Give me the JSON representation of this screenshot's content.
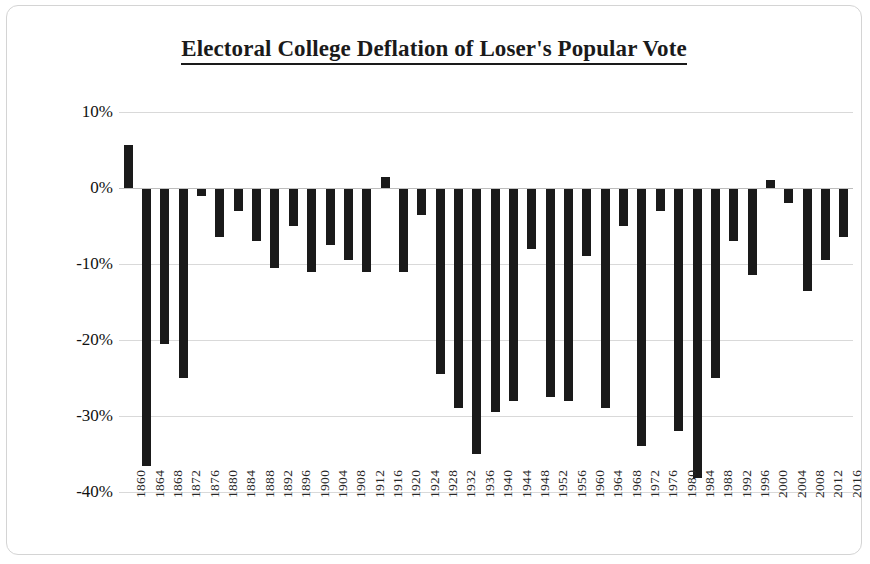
{
  "chart_data": {
    "type": "bar",
    "title": "Electoral College Deflation of Loser's Popular Vote",
    "xlabel": "",
    "ylabel": "Electoral Vote % Minus Popular Vote  %",
    "ylim": [
      -40,
      10
    ],
    "ytick_labels": [
      "10%",
      "0%",
      "-10%",
      "-20%",
      "-30%",
      "-40%"
    ],
    "ytick_values": [
      10,
      0,
      -10,
      -20,
      -30,
      -40
    ],
    "grid": true,
    "legend": "none",
    "bar_color": "#1a1a1a",
    "categories": [
      "1860",
      "1864",
      "1868",
      "1872",
      "1876",
      "1880",
      "1884",
      "1888",
      "1892",
      "1896",
      "1900",
      "1904",
      "1908",
      "1912",
      "1916",
      "1920",
      "1924",
      "1928",
      "1932",
      "1936",
      "1940",
      "1944",
      "1948",
      "1952",
      "1956",
      "1960",
      "1964",
      "1968",
      "1972",
      "1976",
      "1980",
      "1984",
      "1988",
      "1992",
      "1996",
      "2000",
      "2004",
      "2008",
      "2012",
      "2016"
    ],
    "values": [
      5.7,
      -36.6,
      -20.5,
      -25.0,
      -1.0,
      -6.5,
      -3.0,
      -7.0,
      -10.5,
      -5.0,
      -11.0,
      -7.5,
      -9.5,
      -11.0,
      1.5,
      -11.0,
      -3.5,
      -24.5,
      -29.0,
      -35.0,
      -29.5,
      -28.0,
      -8.0,
      -27.5,
      -28.0,
      -9.0,
      -29.0,
      -5.0,
      -34.0,
      -3.0,
      -32.0,
      -38.2,
      -25.0,
      -7.0,
      -11.5,
      1.0,
      -2.0,
      -13.5,
      -9.5,
      -6.5
    ]
  }
}
